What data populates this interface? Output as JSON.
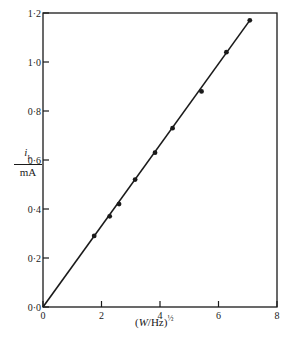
{
  "chart_data": {
    "type": "line",
    "title": "",
    "xlabel": "(W/Hz)^1/2",
    "ylabel": "i_L / mA",
    "xlim": [
      0,
      8
    ],
    "ylim": [
      0,
      1.2
    ],
    "grid": false,
    "legend": null,
    "x_ticks": [
      "0",
      "2",
      "4",
      "6",
      "8"
    ],
    "y_ticks": [
      "0·0",
      "0·2",
      "0·4",
      "0·6",
      "0·8",
      "1·0",
      "1·2"
    ],
    "series": [
      {
        "name": "measured points",
        "style": "scatter",
        "x": [
          1.75,
          2.28,
          2.6,
          3.15,
          3.83,
          4.43,
          5.42,
          6.27,
          7.07
        ],
        "y": [
          0.29,
          0.37,
          0.42,
          0.52,
          0.63,
          0.73,
          0.88,
          1.04,
          1.17
        ]
      },
      {
        "name": "fitted line",
        "style": "line",
        "x": [
          0,
          7.07
        ],
        "y": [
          0,
          1.17
        ]
      }
    ]
  },
  "labels": {
    "y_num": "i",
    "y_sub": "L",
    "y_den": "mA",
    "x_open": "(",
    "x_var": "W",
    "x_rest": "/Hz)",
    "x_exp": "½"
  }
}
